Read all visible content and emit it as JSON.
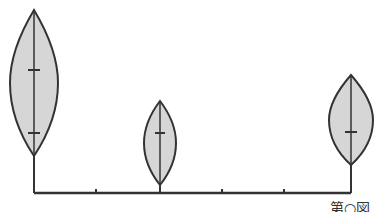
{
  "diagram": {
    "type": "kite-plot / spindle diagram",
    "baseline": {
      "x1": 34,
      "x2": 351,
      "y": 193,
      "ticks_x": [
        96,
        222,
        284
      ]
    },
    "colors": {
      "stroke": "#333333",
      "fill": "#d6d6d6",
      "background": "#ffffff"
    },
    "spindles": [
      {
        "id": "left",
        "stem_x": 34,
        "top_y": 10,
        "bottom_y": 156,
        "half_width": 24,
        "marks_y": [
          70,
          133
        ]
      },
      {
        "id": "middle",
        "stem_x": 160,
        "top_y": 101,
        "bottom_y": 185,
        "half_width": 16,
        "marks_y": [
          133
        ]
      },
      {
        "id": "right",
        "stem_x": 351,
        "top_y": 75,
        "bottom_y": 165,
        "half_width": 22,
        "marks_y": [
          132
        ]
      }
    ]
  },
  "caption": {
    "text": "第○図"
  }
}
